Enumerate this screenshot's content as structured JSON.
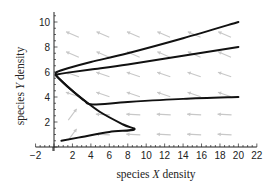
{
  "chart_data": {
    "type": "line",
    "title": "",
    "xlabel": "species X density",
    "ylabel": "species Y density",
    "xlabel_parts": [
      "species ",
      "X",
      " density"
    ],
    "ylabel_parts": [
      "species ",
      "Y",
      " density"
    ],
    "xlim": [
      -2,
      22
    ],
    "ylim": [
      0,
      10.8
    ],
    "xticks": [
      -2,
      2,
      4,
      6,
      8,
      10,
      12,
      14,
      16,
      18,
      20,
      22
    ],
    "yticks": [
      2,
      4,
      6,
      8,
      10
    ],
    "grid": false,
    "legend": null,
    "vector_field": {
      "color": "#c8c8c8",
      "description": "direction field arrows; mostly pointing toward decreasing X and slightly increasing Y in the upper region, pointing up-right near the lower-left"
    },
    "series": [
      {
        "name": "trajectory-1",
        "color": "#111111",
        "x": [
          20,
          14,
          8,
          4,
          1.5,
          0.3,
          0.2
        ],
        "y": [
          10,
          8.7,
          7.5,
          6.8,
          6.3,
          6.0,
          5.8
        ]
      },
      {
        "name": "trajectory-2",
        "color": "#111111",
        "x": [
          20,
          14,
          8,
          4,
          1.5,
          0.3,
          0.2
        ],
        "y": [
          8,
          7.3,
          6.6,
          6.2,
          5.95,
          5.8,
          5.75
        ]
      },
      {
        "name": "trajectory-3",
        "color": "#111111",
        "x": [
          20,
          14,
          8,
          4.2,
          3.3,
          2,
          0.8,
          0.2
        ],
        "y": [
          4,
          3.85,
          3.6,
          3.4,
          3.7,
          4.5,
          5.3,
          5.75
        ]
      },
      {
        "name": "trajectory-4",
        "color": "#111111",
        "x": [
          0.8,
          3,
          6,
          8.7,
          7.5,
          5,
          3,
          1.5,
          0.5,
          0.2
        ],
        "y": [
          0.5,
          0.8,
          1.2,
          1.4,
          1.8,
          2.8,
          3.9,
          4.8,
          5.5,
          5.75
        ]
      }
    ]
  }
}
